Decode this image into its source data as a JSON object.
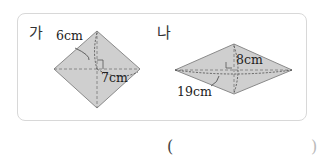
{
  "problem": {
    "figures": [
      {
        "label": "가",
        "shape": "rhombus",
        "measure_1": "6cm",
        "measure_2": "7cm",
        "vertices": {
          "top": [
            97,
            31
          ],
          "left": [
            54,
            69
          ],
          "right": [
            140,
            69
          ],
          "bottom": [
            97,
            108
          ]
        }
      },
      {
        "label": "나",
        "shape": "rhombus",
        "measure_1": "8cm",
        "measure_2": "19cm",
        "vertices": {
          "top": [
            234,
            44
          ],
          "left": [
            175,
            70
          ],
          "right": [
            292,
            70
          ],
          "bottom": [
            234,
            94
          ]
        }
      }
    ],
    "answer_open": "(",
    "answer_close": ")",
    "colors": {
      "fill": "#cfcfcf",
      "stroke": "#8a8a8a",
      "dash": "#777777",
      "border": "#d8d8d8"
    }
  }
}
